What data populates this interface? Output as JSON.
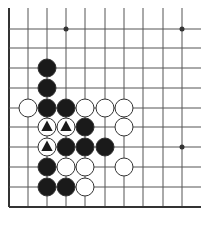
{
  "diagram": {
    "type": "go-board-fragment",
    "colors": {
      "background": "#ffffff",
      "line": "#555555",
      "edge": "#333333",
      "black_stone": "#1a1a1a",
      "white_stone": "#ffffff",
      "stone_outline": "#333333",
      "marker": "#1a1a1a"
    },
    "grid": {
      "columns_x": [
        9,
        28,
        47,
        66,
        85,
        105,
        124,
        143,
        163,
        182
      ],
      "rows_y": [
        29,
        48,
        68,
        88,
        108,
        127,
        147,
        167,
        187,
        207
      ],
      "top_open_y": 8,
      "right_open_x": 201,
      "edges": [
        "left",
        "bottom"
      ]
    },
    "star_points": [
      {
        "col": 3,
        "row": 0
      },
      {
        "col": 9,
        "row": 0
      },
      {
        "col": 9,
        "row": 6
      }
    ],
    "stone_radius": 9,
    "stones": [
      {
        "col": 2,
        "row": 2,
        "color": "black"
      },
      {
        "col": 2,
        "row": 3,
        "color": "black"
      },
      {
        "col": 1,
        "row": 4,
        "color": "white"
      },
      {
        "col": 2,
        "row": 4,
        "color": "black"
      },
      {
        "col": 3,
        "row": 4,
        "color": "black"
      },
      {
        "col": 4,
        "row": 4,
        "color": "white"
      },
      {
        "col": 5,
        "row": 4,
        "color": "white"
      },
      {
        "col": 6,
        "row": 4,
        "color": "white"
      },
      {
        "col": 2,
        "row": 5,
        "color": "white",
        "marker": "triangle"
      },
      {
        "col": 3,
        "row": 5,
        "color": "white",
        "marker": "triangle"
      },
      {
        "col": 4,
        "row": 5,
        "color": "black"
      },
      {
        "col": 6,
        "row": 5,
        "color": "white"
      },
      {
        "col": 2,
        "row": 6,
        "color": "white",
        "marker": "triangle"
      },
      {
        "col": 3,
        "row": 6,
        "color": "black"
      },
      {
        "col": 4,
        "row": 6,
        "color": "black"
      },
      {
        "col": 5,
        "row": 6,
        "color": "black"
      },
      {
        "col": 2,
        "row": 7,
        "color": "black"
      },
      {
        "col": 3,
        "row": 7,
        "color": "white"
      },
      {
        "col": 4,
        "row": 7,
        "color": "white"
      },
      {
        "col": 6,
        "row": 7,
        "color": "white"
      },
      {
        "col": 2,
        "row": 8,
        "color": "black"
      },
      {
        "col": 3,
        "row": 8,
        "color": "black"
      },
      {
        "col": 4,
        "row": 8,
        "color": "white"
      }
    ]
  }
}
